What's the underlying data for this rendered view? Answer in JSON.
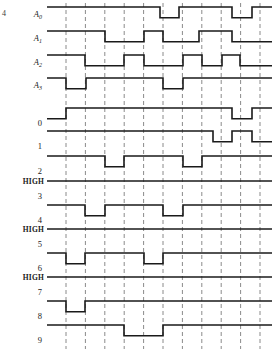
{
  "figure": {
    "corner_mark": "4",
    "geometry": {
      "x_start": 47,
      "x_end": 272,
      "grid_start": 66,
      "grid_step": 19.4,
      "grid_count": 11,
      "amplitude": 9
    },
    "colors": {
      "wave": "#1a1a1a",
      "grid": "#8a8a8a",
      "background": "#ffffff"
    }
  },
  "chart_data": {
    "type": "line",
    "xlabel": "",
    "ylabel": "",
    "grid": true,
    "legend_position": "none",
    "x_axis": {
      "unit": "clock period",
      "tick_count": 11,
      "ticks": [
        1,
        2,
        3,
        4,
        5,
        6,
        7,
        8,
        9,
        10,
        11
      ]
    },
    "logic_levels": {
      "low": 0,
      "high": 1
    },
    "series": [
      {
        "name": "A0",
        "label": "A",
        "subscript": "0",
        "kind": "address-input",
        "note": "most significant address bit",
        "values": [
          0,
          0,
          0,
          0,
          0,
          0,
          0,
          0,
          1,
          0,
          0,
          0,
          0,
          1,
          0,
          0
        ]
      },
      {
        "name": "A1",
        "label": "A",
        "subscript": "1",
        "kind": "address-input",
        "values": [
          0,
          0,
          0,
          0,
          1,
          1,
          1,
          1,
          0,
          0,
          1,
          1,
          0,
          0,
          0,
          0
        ]
      },
      {
        "name": "A2",
        "label": "A",
        "subscript": "2",
        "kind": "address-input",
        "values": [
          0,
          0,
          1,
          1,
          0,
          0,
          1,
          1,
          0,
          1,
          0,
          1,
          0,
          0,
          0,
          0
        ]
      },
      {
        "name": "A3",
        "label": "A",
        "subscript": "3",
        "kind": "address-input",
        "note": "least significant address bit",
        "values": [
          0,
          1,
          0,
          1,
          0,
          1,
          0,
          1,
          0,
          0,
          0,
          0,
          0,
          0,
          0,
          0
        ]
      },
      {
        "name": "0",
        "label": "0",
        "kind": "decoder-output",
        "active": "low",
        "values": [
          0,
          1,
          1,
          1,
          1,
          1,
          1,
          1,
          1,
          1,
          1,
          1,
          1,
          1,
          1,
          1
        ]
      },
      {
        "name": "1",
        "label": "1",
        "kind": "decoder-output",
        "active": "low",
        "values": [
          1,
          1,
          1,
          1,
          1,
          1,
          1,
          1,
          1,
          1,
          1,
          1,
          0,
          1,
          1,
          1
        ]
      },
      {
        "name": "2",
        "label": "2",
        "kind": "decoder-output",
        "active": "low",
        "values": [
          1,
          1,
          1,
          0,
          1,
          1,
          1,
          1,
          1,
          0,
          1,
          1,
          1,
          1,
          1,
          1
        ]
      },
      {
        "name": "3",
        "label": "3",
        "kind": "decoder-output",
        "active": "low",
        "static_label": "HIGH",
        "values": [
          1,
          1,
          1,
          1,
          1,
          1,
          1,
          1,
          1,
          1,
          1,
          1,
          1,
          1,
          1,
          1
        ]
      },
      {
        "name": "4",
        "label": "4",
        "kind": "decoder-output",
        "active": "low",
        "values": [
          1,
          1,
          0,
          1,
          1,
          1,
          1,
          0,
          1,
          1,
          1,
          1,
          1,
          1,
          1,
          1
        ]
      },
      {
        "name": "5",
        "label": "5",
        "kind": "decoder-output",
        "active": "low",
        "static_label": "HIGH",
        "values": [
          1,
          1,
          1,
          1,
          1,
          1,
          1,
          1,
          1,
          1,
          1,
          1,
          1,
          1,
          1,
          1
        ]
      },
      {
        "name": "6",
        "label": "6",
        "kind": "decoder-output",
        "active": "low",
        "values": [
          1,
          1,
          1,
          1,
          1,
          1,
          1,
          1,
          1,
          1,
          0,
          1,
          1,
          1,
          1,
          1
        ]
      },
      {
        "name": "7",
        "label": "7",
        "kind": "decoder-output",
        "active": "low",
        "static_label": "HIGH",
        "values": [
          1,
          1,
          1,
          1,
          1,
          1,
          1,
          1,
          1,
          1,
          1,
          1,
          1,
          1,
          1,
          1
        ]
      },
      {
        "name": "8",
        "label": "8",
        "kind": "decoder-output",
        "active": "low",
        "values": [
          1,
          0,
          1,
          1,
          1,
          1,
          1,
          1,
          1,
          1,
          1,
          1,
          1,
          1,
          1,
          1
        ]
      },
      {
        "name": "9",
        "label": "9",
        "kind": "decoder-output",
        "active": "low",
        "values": [
          1,
          1,
          1,
          1,
          1,
          0,
          1,
          1,
          1,
          1,
          1,
          1,
          1,
          1,
          1,
          1
        ]
      }
    ]
  },
  "rows": [
    {
      "id": "A0",
      "label": "A",
      "sub": "0",
      "high_label": "",
      "y": 16,
      "italic": true,
      "segments": [
        [
          47,
          1
        ],
        [
          160,
          0
        ],
        [
          179,
          1
        ],
        [
          232,
          0
        ],
        [
          252,
          1
        ],
        [
          272,
          1
        ]
      ]
    },
    {
      "id": "A1",
      "label": "A",
      "sub": "1",
      "high_label": "",
      "y": 40,
      "italic": true,
      "segments": [
        [
          47,
          1
        ],
        [
          105,
          0
        ],
        [
          144,
          1
        ],
        [
          163,
          0
        ],
        [
          199,
          1
        ],
        [
          232,
          0
        ],
        [
          272,
          0
        ]
      ]
    },
    {
      "id": "A2",
      "label": "A",
      "sub": "2",
      "high_label": "",
      "y": 64,
      "italic": true,
      "segments": [
        [
          47,
          1
        ],
        [
          85,
          0
        ],
        [
          124,
          1
        ],
        [
          144,
          0
        ],
        [
          183,
          1
        ],
        [
          202,
          0
        ],
        [
          222,
          1
        ],
        [
          240,
          0
        ],
        [
          272,
          0
        ]
      ]
    },
    {
      "id": "A3",
      "label": "A",
      "sub": "3",
      "high_label": "",
      "y": 87,
      "italic": true,
      "segments": [
        [
          47,
          1
        ],
        [
          66,
          0
        ],
        [
          86,
          1
        ],
        [
          163,
          0
        ],
        [
          183,
          1
        ],
        [
          272,
          1
        ]
      ]
    },
    {
      "id": "0",
      "label": "0",
      "sub": "",
      "high_label": "",
      "y": 117,
      "italic": false,
      "segments": [
        [
          47,
          0
        ],
        [
          66,
          1
        ],
        [
          232,
          0
        ],
        [
          252,
          1
        ],
        [
          272,
          1
        ]
      ]
    },
    {
      "id": "1",
      "label": "1",
      "sub": "",
      "high_label": "",
      "y": 140,
      "italic": false,
      "segments": [
        [
          47,
          1
        ],
        [
          213,
          0
        ],
        [
          232,
          1
        ],
        [
          252,
          0
        ],
        [
          272,
          0
        ]
      ]
    },
    {
      "id": "2",
      "label": "2",
      "sub": "",
      "high_label": "",
      "y": 165,
      "italic": false,
      "segments": [
        [
          47,
          1
        ],
        [
          105,
          0
        ],
        [
          124,
          1
        ],
        [
          183,
          0
        ],
        [
          202,
          1
        ],
        [
          272,
          1
        ]
      ]
    },
    {
      "id": "3",
      "label": "3",
      "sub": "",
      "high_label": "HIGH",
      "y": 190,
      "italic": false,
      "segments": [
        [
          47,
          1
        ],
        [
          272,
          1
        ]
      ]
    },
    {
      "id": "4",
      "label": "4",
      "sub": "",
      "high_label": "",
      "y": 214,
      "italic": false,
      "segments": [
        [
          47,
          1
        ],
        [
          85,
          0
        ],
        [
          105,
          1
        ],
        [
          163,
          0
        ],
        [
          183,
          1
        ],
        [
          272,
          1
        ]
      ]
    },
    {
      "id": "5",
      "label": "5",
      "sub": "",
      "high_label": "HIGH",
      "y": 238,
      "italic": false,
      "segments": [
        [
          47,
          1
        ],
        [
          272,
          1
        ]
      ]
    },
    {
      "id": "6",
      "label": "6",
      "sub": "",
      "high_label": "",
      "y": 262,
      "italic": false,
      "segments": [
        [
          47,
          1
        ],
        [
          66,
          0
        ],
        [
          85,
          1
        ],
        [
          144,
          0
        ],
        [
          163,
          1
        ],
        [
          272,
          1
        ]
      ]
    },
    {
      "id": "7",
      "label": "7",
      "sub": "",
      "high_label": "HIGH",
      "y": 286,
      "italic": false,
      "segments": [
        [
          47,
          1
        ],
        [
          272,
          1
        ]
      ]
    },
    {
      "id": "8",
      "label": "8",
      "sub": "",
      "high_label": "",
      "y": 310,
      "italic": false,
      "segments": [
        [
          47,
          1
        ],
        [
          66,
          0
        ],
        [
          85,
          1
        ],
        [
          272,
          1
        ]
      ]
    },
    {
      "id": "9",
      "label": "9",
      "sub": "",
      "high_label": "",
      "y": 334,
      "italic": false,
      "segments": [
        [
          47,
          1
        ],
        [
          124,
          0
        ],
        [
          163,
          1
        ],
        [
          272,
          1
        ]
      ]
    }
  ]
}
